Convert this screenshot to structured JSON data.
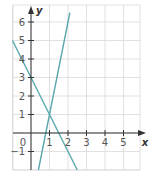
{
  "chart_data": {
    "type": "line",
    "title": "",
    "xlabel": "x",
    "ylabel": "y",
    "xlim": [
      -1,
      5.5
    ],
    "ylim": [
      -2,
      6.8
    ],
    "grid": true,
    "x_ticks": [
      1,
      2,
      3,
      4,
      5
    ],
    "y_ticks": [
      -1,
      1,
      2,
      3,
      4,
      5,
      6
    ],
    "origin_label": "0",
    "series": [
      {
        "name": "y = 5x - 4",
        "slope": 5,
        "intercept": -4,
        "color": "#5aa9ad",
        "points": [
          [
            0.4,
            -2
          ],
          [
            2.1,
            6.5
          ]
        ]
      },
      {
        "name": "y = -2x + 3",
        "slope": -2,
        "intercept": 3,
        "color": "#5aa9ad",
        "points": [
          [
            -1,
            5
          ],
          [
            2.5,
            -2
          ]
        ]
      }
    ],
    "intersection": [
      1,
      1
    ],
    "colors": {
      "grid": "#d9d9d9",
      "axis": "#333333",
      "line": "#5aa9ad"
    }
  }
}
